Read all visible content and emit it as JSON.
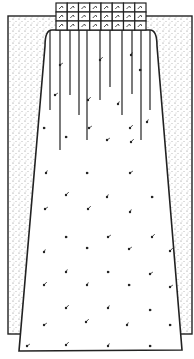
{
  "illustration": {
    "title": "Smocked skirt pattern drawing",
    "colors": {
      "ink": "#222222",
      "paper": "#ffffff",
      "stipple": "#555555"
    },
    "background_panel": {
      "x": 8,
      "y": 16,
      "w": 184,
      "h": 318
    },
    "smocking_grid": {
      "x": 56,
      "y": 3,
      "cols": 8,
      "rows": 3,
      "cell_w": 11.25,
      "cell_h": 9
    },
    "skirt": {
      "top_left": [
        52,
        30
      ],
      "top_right": [
        150,
        30
      ],
      "shoulder_left": [
        45,
        46
      ],
      "shoulder_right": [
        157,
        46
      ],
      "bottom_left": [
        19,
        351
      ],
      "bottom_right": [
        182,
        350
      ]
    },
    "gather_lines": [
      {
        "x": 50,
        "y2": 110
      },
      {
        "x": 60,
        "y2": 150
      },
      {
        "x": 70,
        "y2": 95
      },
      {
        "x": 79,
        "y2": 115
      },
      {
        "x": 87,
        "y2": 140
      },
      {
        "x": 100,
        "y2": 100
      },
      {
        "x": 110,
        "y2": 87
      },
      {
        "x": 122,
        "y2": 115
      },
      {
        "x": 132,
        "y2": 94
      },
      {
        "x": 141,
        "y2": 140
      },
      {
        "x": 150,
        "y2": 110
      }
    ],
    "motifs": [
      [
        44,
        128
      ],
      [
        89,
        128
      ],
      [
        130,
        128
      ],
      [
        147,
        122
      ],
      [
        66,
        137
      ],
      [
        107,
        140
      ],
      [
        131,
        142
      ],
      [
        46,
        173
      ],
      [
        87,
        173
      ],
      [
        130,
        173
      ],
      [
        66,
        195
      ],
      [
        107,
        197
      ],
      [
        152,
        197
      ],
      [
        45,
        209
      ],
      [
        88,
        209
      ],
      [
        130,
        212
      ],
      [
        66,
        237
      ],
      [
        108,
        237
      ],
      [
        152,
        237
      ],
      [
        44,
        252
      ],
      [
        87,
        248
      ],
      [
        129,
        249
      ],
      [
        170,
        251
      ],
      [
        66,
        272
      ],
      [
        108,
        272
      ],
      [
        150,
        274
      ],
      [
        44,
        285
      ],
      [
        87,
        285
      ],
      [
        129,
        285
      ],
      [
        170,
        287
      ],
      [
        66,
        308
      ],
      [
        108,
        308
      ],
      [
        150,
        310
      ],
      [
        44,
        325
      ],
      [
        86,
        322
      ],
      [
        127,
        325
      ],
      [
        170,
        325
      ],
      [
        27,
        346
      ],
      [
        66,
        345
      ],
      [
        108,
        346
      ],
      [
        150,
        346
      ],
      [
        55,
        95
      ],
      [
        88,
        100
      ],
      [
        118,
        104
      ],
      [
        140,
        70
      ],
      [
        60,
        65
      ],
      [
        100,
        60
      ],
      [
        131,
        55
      ]
    ]
  }
}
